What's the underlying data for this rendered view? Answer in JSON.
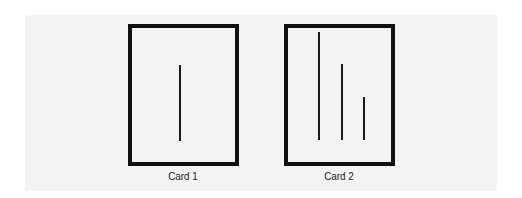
{
  "cards": [
    {
      "label": "Card 1",
      "lines": [
        {
          "x": 51,
          "top": 41,
          "height": 76
        }
      ]
    },
    {
      "label": "Card 2",
      "lines": [
        {
          "x": 34,
          "top": 8,
          "height": 108
        },
        {
          "x": 57,
          "top": 40,
          "height": 76
        },
        {
          "x": 79,
          "top": 73,
          "height": 43
        }
      ]
    }
  ]
}
